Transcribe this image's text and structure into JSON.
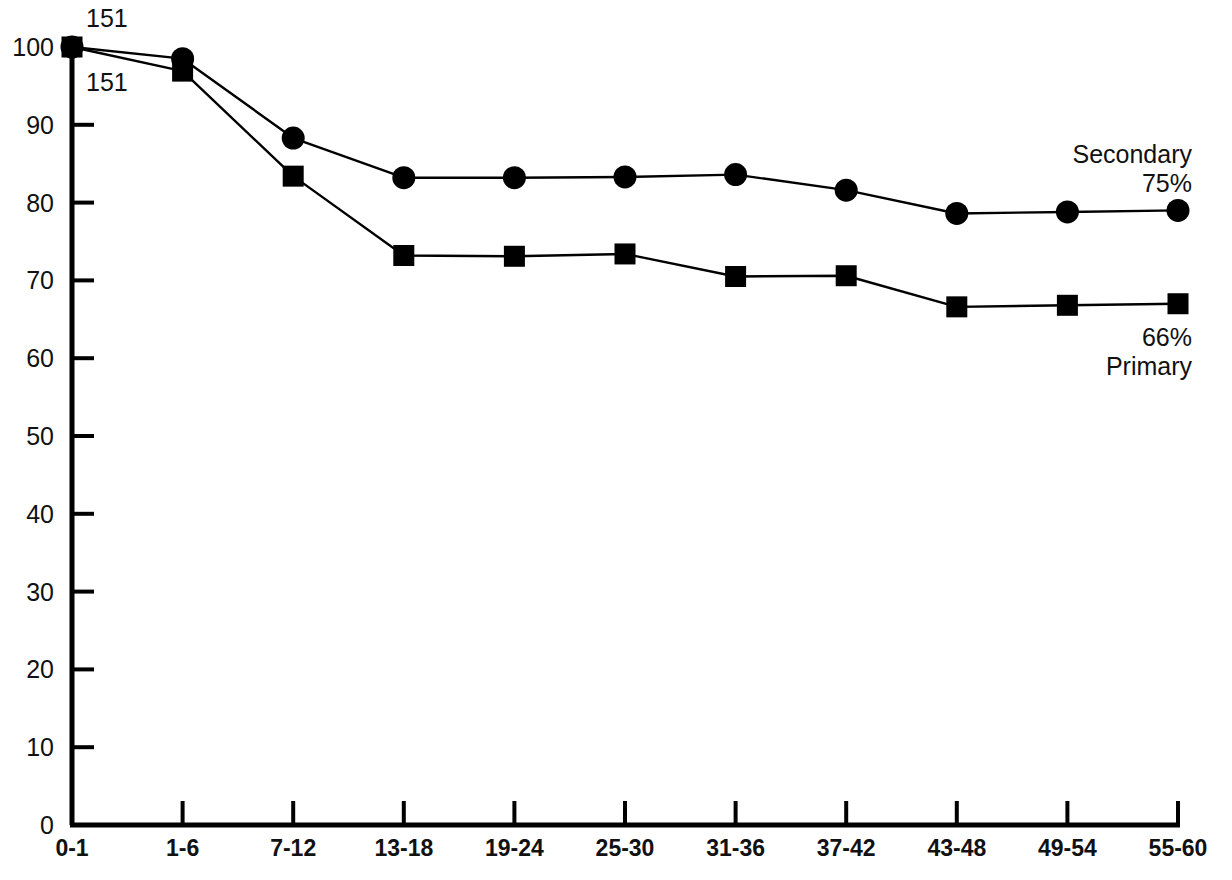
{
  "chart_data": {
    "type": "line",
    "title": "",
    "xlabel": "",
    "ylabel": "",
    "categories": [
      "0-1",
      "1-6",
      "7-12",
      "13-18",
      "19-24",
      "25-30",
      "31-36",
      "37-42",
      "43-48",
      "49-54",
      "55-60"
    ],
    "ylim": [
      0,
      100
    ],
    "yticks": [
      0,
      10,
      20,
      30,
      40,
      50,
      60,
      70,
      80,
      90,
      100
    ],
    "ytick_labels": [
      "0",
      "10",
      "20",
      "30",
      "40",
      "50",
      "60",
      "70",
      "80",
      "90",
      "100"
    ],
    "grid": false,
    "legend_position": "inline-right",
    "series": [
      {
        "name": "Secondary",
        "marker": "circle",
        "end_label": "Secondary",
        "end_value_label": "75%",
        "start_count_label": "151",
        "values": [
          100,
          98.5,
          88.3,
          83.2,
          83.2,
          83.3,
          83.6,
          81.6,
          78.6,
          78.8,
          79.0
        ]
      },
      {
        "name": "Primary",
        "marker": "square",
        "end_label": "Primary",
        "end_value_label": "66%",
        "start_count_label": "151",
        "values": [
          100,
          96.9,
          83.4,
          73.2,
          73.1,
          73.4,
          70.5,
          70.6,
          66.6,
          66.8,
          67.0
        ]
      }
    ],
    "annotations": [
      {
        "text": "151",
        "x_category": "0-1",
        "position": "above-axis-top"
      },
      {
        "text": "151",
        "x_category": "0-1",
        "position": "below-axis-top"
      }
    ]
  },
  "colors": {
    "line": "#000000",
    "marker": "#000000",
    "axis": "#000000",
    "text": "#111111",
    "background": "#ffffff"
  }
}
